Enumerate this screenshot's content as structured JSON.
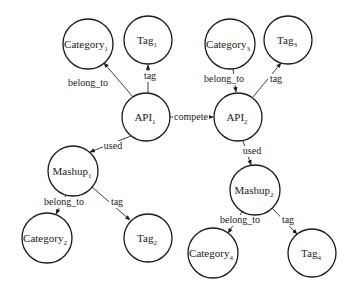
{
  "diagram": {
    "type": "knowledge-graph",
    "nodes": [
      {
        "id": "category1",
        "base": "Category",
        "sub": "1",
        "cx": 88,
        "cy": 44,
        "r": 25
      },
      {
        "id": "tag1",
        "base": "Tag",
        "sub": "1",
        "cx": 148,
        "cy": 40,
        "r": 24
      },
      {
        "id": "api1",
        "base": "API",
        "sub": "1",
        "cx": 146,
        "cy": 117,
        "r": 24
      },
      {
        "id": "category3",
        "base": "Category",
        "sub": "3",
        "cx": 230,
        "cy": 44,
        "r": 25
      },
      {
        "id": "tag3",
        "base": "Tag",
        "sub": "3",
        "cx": 288,
        "cy": 40,
        "r": 24
      },
      {
        "id": "api2",
        "base": "API",
        "sub": "2",
        "cx": 238,
        "cy": 117,
        "r": 24
      },
      {
        "id": "mashup1",
        "base": "Mashup",
        "sub": "1",
        "cx": 73,
        "cy": 171,
        "r": 25
      },
      {
        "id": "category2",
        "base": "Category",
        "sub": "2",
        "cx": 47,
        "cy": 238,
        "r": 25
      },
      {
        "id": "tag2",
        "base": "Tag",
        "sub": "2",
        "cx": 148,
        "cy": 238,
        "r": 24
      },
      {
        "id": "mashup2",
        "base": "Mashup",
        "sub": "2",
        "cx": 255,
        "cy": 190,
        "r": 25
      },
      {
        "id": "category4",
        "base": "Category",
        "sub": "4",
        "cx": 213,
        "cy": 253,
        "r": 25
      },
      {
        "id": "tag4",
        "base": "Tag",
        "sub": "4",
        "cx": 312,
        "cy": 253,
        "r": 24
      }
    ],
    "edges": [
      {
        "from": "api1",
        "to": "category1",
        "label": "belong_to",
        "lx": 88,
        "ly": 86
      },
      {
        "from": "api1",
        "to": "tag1",
        "label": "tag",
        "lx": 150,
        "ly": 79
      },
      {
        "from": "api1",
        "to": "api2",
        "label": "compete",
        "lx": 191,
        "ly": 121
      },
      {
        "from": "api1",
        "to": "mashup1",
        "label": "used",
        "lx": 113,
        "ly": 149
      },
      {
        "from": "category3",
        "to": "api2",
        "label": "belong_to",
        "lx": 224,
        "ly": 82
      },
      {
        "from": "api2",
        "to": "tag3",
        "label": "tag",
        "lx": 276,
        "ly": 82
      },
      {
        "from": "api2",
        "to": "mashup2",
        "label": "used",
        "lx": 252,
        "ly": 154
      },
      {
        "from": "mashup1",
        "to": "category2",
        "label": "belong_to",
        "lx": 64,
        "ly": 205
      },
      {
        "from": "mashup1",
        "to": "tag2",
        "label": "tag",
        "lx": 117,
        "ly": 205
      },
      {
        "from": "mashup2",
        "to": "category4",
        "label": "belong_to",
        "lx": 240,
        "ly": 223
      },
      {
        "from": "mashup2",
        "to": "tag4",
        "label": "tag",
        "lx": 288,
        "ly": 223
      }
    ]
  },
  "labels": {
    "category1": "Category",
    "category1_sub": "1",
    "tag1": "Tag",
    "tag1_sub": "1",
    "api1": "API",
    "api1_sub": "1",
    "category3": "Category",
    "category3_sub": "3",
    "tag3": "Tag",
    "tag3_sub": "3",
    "api2": "API",
    "api2_sub": "2",
    "mashup1": "Mashup",
    "mashup1_sub": "1",
    "category2": "Category",
    "category2_sub": "2",
    "tag2": "Tag",
    "tag2_sub": "2",
    "mashup2": "Mashup",
    "mashup2_sub": "2",
    "category4": "Category",
    "category4_sub": "4",
    "tag4": "Tag",
    "tag4_sub": "4",
    "edge_api1_category1": "belong_to",
    "edge_api1_tag1": "tag",
    "edge_api1_api2": "compete",
    "edge_api1_mashup1": "used",
    "edge_category3_api2": "belong_to",
    "edge_api2_tag3": "tag",
    "edge_api2_mashup2": "used",
    "edge_mashup1_category2": "belong_to",
    "edge_mashup1_tag2": "tag",
    "edge_mashup2_category4": "belong_to",
    "edge_mashup2_tag4": "tag"
  }
}
